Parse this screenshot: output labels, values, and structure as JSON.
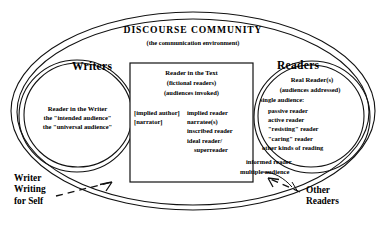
{
  "diagram": {
    "title": "DISCOURSE  COMMUNITY",
    "subtitle": "(the communication environment)",
    "writers": {
      "heading": "Writers",
      "circle_title": "Reader in the Writer",
      "circle_lines": [
        "the \"intended audience\"",
        "the \"universal audience\""
      ],
      "corner_label_lines": [
        "Writer",
        "Writing",
        "for Self"
      ]
    },
    "text_box": {
      "heading": "Reader in the Text",
      "sub_lines": [
        "(fictional readers)",
        "(audiences invoked)"
      ],
      "left_column": [
        "[implied author]",
        "[narrator]"
      ],
      "right_column": [
        "implied reader",
        "narratee(s)",
        "inscribed reader",
        "ideal reader/",
        "superreader"
      ]
    },
    "readers": {
      "heading": "Readers",
      "circle_title": "Real  Reader(s)",
      "sub_line": "(audiences addressed)",
      "group_label": "single audience:",
      "list": [
        "passive reader",
        "active reader",
        "\"resisting\" reader",
        "\"caring\" reader",
        "other kinds of reading"
      ],
      "outside_lines": [
        "informed reader",
        "multiple audience"
      ],
      "corner_label_lines": [
        "Other",
        "Readers"
      ]
    },
    "colors": {
      "stroke": "#111111",
      "background": "#ffffff",
      "text": "#000000"
    }
  }
}
